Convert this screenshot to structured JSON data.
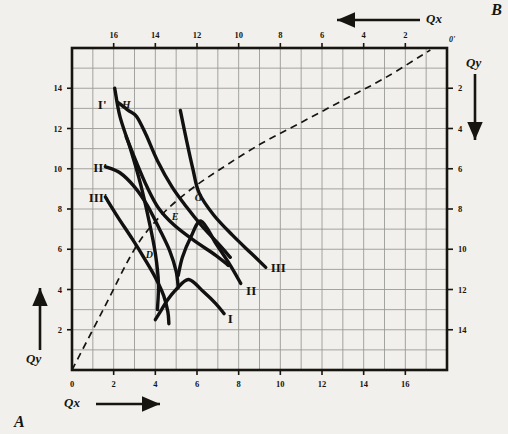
{
  "figure": {
    "corner_a": "A",
    "corner_b": "B",
    "origin_prime": "0'"
  },
  "axes": {
    "bottom": {
      "name": "Qx",
      "arrow": "right",
      "zero_label": "0",
      "ticks": [
        0,
        2,
        4,
        6,
        8,
        10,
        12,
        14,
        16
      ],
      "range": [
        0,
        18
      ],
      "direction": "increasing-right"
    },
    "left": {
      "name": "Qy",
      "arrow": "up",
      "ticks": [
        2,
        4,
        6,
        8,
        10,
        12,
        14
      ],
      "range": [
        0,
        16
      ],
      "direction": "increasing-up"
    },
    "top": {
      "name": "Qx",
      "arrow": "left",
      "ticks": [
        2,
        4,
        6,
        8,
        10,
        12,
        14,
        16
      ],
      "range": [
        0,
        18
      ],
      "direction": "increasing-left"
    },
    "right": {
      "name": "Qy",
      "arrow": "down",
      "ticks": [
        2,
        4,
        6,
        8,
        10,
        12,
        14
      ],
      "range": [
        0,
        16
      ],
      "direction": "increasing-down"
    }
  },
  "chart_data": {
    "type": "line",
    "title": "",
    "xlabel": "Qx",
    "ylabel": "Qy",
    "xlim": [
      0,
      18
    ],
    "ylim": [
      0,
      16
    ],
    "grid": true,
    "grid_step": 1,
    "legend": "inline-curve-end-labels",
    "series": [
      {
        "name": "I",
        "label": "I",
        "style": "solid-thick",
        "label_pos": [
          7.6,
          2.6
        ],
        "points": [
          [
            4.0,
            2.5
          ],
          [
            4.3,
            3.0
          ],
          [
            4.6,
            3.5
          ],
          [
            5.0,
            4.0
          ],
          [
            5.6,
            4.5
          ],
          [
            6.3,
            3.9
          ],
          [
            6.9,
            3.3
          ],
          [
            7.3,
            2.8
          ]
        ]
      },
      {
        "name": "II",
        "label": "II",
        "style": "solid-thick",
        "label_pos": [
          8.6,
          4.0
        ],
        "points": [
          [
            5.1,
            4.7
          ],
          [
            5.3,
            5.6
          ],
          [
            5.7,
            6.6
          ],
          [
            6.2,
            7.4
          ],
          [
            6.9,
            6.3
          ],
          [
            7.6,
            5.2
          ],
          [
            8.1,
            4.3
          ]
        ]
      },
      {
        "name": "III",
        "label": "III",
        "style": "solid-thick",
        "label_pos": [
          9.9,
          5.1
        ],
        "points": [
          [
            5.2,
            12.9
          ],
          [
            5.5,
            11.4
          ],
          [
            5.8,
            10.0
          ],
          [
            6.1,
            8.8
          ],
          [
            6.8,
            7.7
          ],
          [
            7.7,
            6.7
          ],
          [
            8.6,
            5.8
          ],
          [
            9.3,
            5.1
          ]
        ]
      },
      {
        "name": "I'",
        "label": "I'",
        "style": "solid-thick",
        "label_pos": [
          1.45,
          13.2
        ],
        "points": [
          [
            2.05,
            14.0
          ],
          [
            2.3,
            12.6
          ],
          [
            2.8,
            11.0
          ],
          [
            3.3,
            9.2
          ],
          [
            3.7,
            7.4
          ],
          [
            4.0,
            5.8
          ],
          [
            4.15,
            4.3
          ],
          [
            4.1,
            3.0
          ]
        ]
      },
      {
        "name": "II'",
        "label": "II'",
        "style": "solid-thick",
        "label_pos": [
          1.35,
          10.1
        ],
        "points": [
          [
            1.6,
            10.1
          ],
          [
            2.3,
            9.8
          ],
          [
            3.0,
            9.1
          ],
          [
            3.6,
            8.2
          ],
          [
            4.2,
            7.0
          ],
          [
            4.7,
            5.9
          ],
          [
            5.0,
            4.9
          ],
          [
            5.1,
            4.1
          ]
        ]
      },
      {
        "name": "III'",
        "label": "III'",
        "style": "solid-thick",
        "label_pos": [
          1.25,
          8.6
        ],
        "points": [
          [
            1.6,
            8.6
          ],
          [
            2.2,
            7.6
          ],
          [
            2.9,
            6.5
          ],
          [
            3.5,
            5.5
          ],
          [
            4.0,
            4.6
          ],
          [
            4.4,
            3.7
          ],
          [
            4.6,
            2.9
          ],
          [
            4.65,
            2.3
          ]
        ]
      },
      {
        "name": "H-branch",
        "label": "H",
        "style": "solid-thick",
        "label_pos": [
          2.6,
          13.2
        ],
        "points": [
          [
            2.2,
            13.3
          ],
          [
            2.7,
            12.9
          ],
          [
            3.1,
            12.6
          ],
          [
            3.55,
            11.7
          ],
          [
            4.1,
            10.4
          ],
          [
            4.8,
            9.1
          ],
          [
            5.5,
            8.1
          ],
          [
            6.2,
            7.2
          ],
          [
            7.0,
            6.3
          ],
          [
            7.6,
            5.6
          ]
        ]
      },
      {
        "name": "branch-through-E",
        "style": "solid-thick",
        "points": [
          [
            2.6,
            11.6
          ],
          [
            3.1,
            10.3
          ],
          [
            3.6,
            9.1
          ],
          [
            4.15,
            8.05
          ],
          [
            4.9,
            7.2
          ],
          [
            5.9,
            6.4
          ],
          [
            6.9,
            5.7
          ],
          [
            7.5,
            5.2
          ]
        ]
      }
    ],
    "contract_curve": {
      "name": "contract-curve",
      "style": "dashed",
      "points": [
        [
          0,
          0
        ],
        [
          1.5,
          3.0
        ],
        [
          3.0,
          6.0
        ],
        [
          4.2,
          7.6
        ],
        [
          5.55,
          8.85
        ],
        [
          7.0,
          9.9
        ],
        [
          9.0,
          11.2
        ],
        [
          11.0,
          12.3
        ],
        [
          13.0,
          13.4
        ],
        [
          15.0,
          14.5
        ],
        [
          17.2,
          15.9
        ]
      ]
    },
    "annotated_points": [
      {
        "label": "H",
        "x": 2.9,
        "y": 13.0
      },
      {
        "label": "G",
        "x": 5.6,
        "y": 8.9
      },
      {
        "label": "E",
        "x": 4.5,
        "y": 7.95
      },
      {
        "label": "D",
        "x": 3.25,
        "y": 6.05
      }
    ]
  }
}
